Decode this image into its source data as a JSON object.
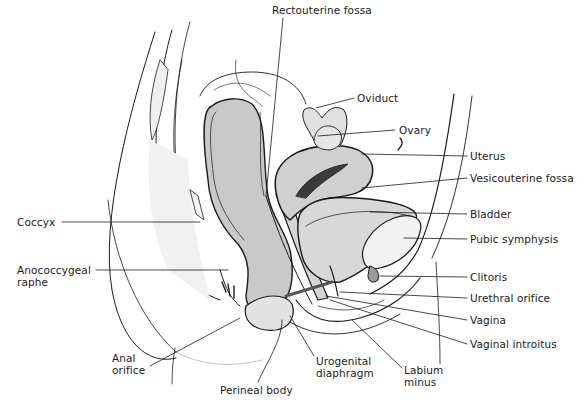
{
  "figure": {
    "colors": {
      "background": "#ffffff",
      "ink": "#1a1a1a",
      "tissue_fill": "#c9c9c9",
      "light_fill": "#e6e6e6",
      "bone_fill": "#f2f2f2"
    }
  },
  "labels": {
    "rectouterine_fossa": "Rectouterine fossa",
    "oviduct": "Oviduct",
    "ovary": "Ovary",
    "uterus": "Uterus",
    "vesicouterine_fossa": "Vesicouterine fossa",
    "bladder": "Bladder",
    "pubic_symphysis": "Pubic symphysis",
    "clitoris": "Clitoris",
    "urethral_orifice": "Urethral orifice",
    "vagina": "Vagina",
    "vaginal_introitus": "Vaginal introitus",
    "coccyx": "Coccyx",
    "anococcygeal_raphe": {
      "line1": "Anococcygeal",
      "line2": "raphe"
    },
    "anal_orifice": {
      "line1": "Anal",
      "line2": "orifice"
    },
    "perineal_body": "Perineal body",
    "urogenital_diaphragm": {
      "line1": "Urogenital",
      "line2": "diaphragm"
    },
    "labium_minus": {
      "line1": "Labium",
      "line2": "minus"
    }
  }
}
